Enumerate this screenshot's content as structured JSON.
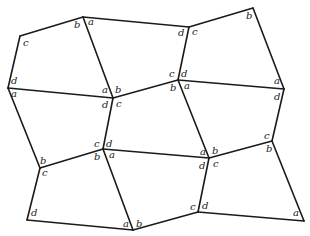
{
  "diagram": {
    "title": "",
    "stroke_color": "#1a1a1a",
    "background": "#ffffff",
    "vertices": {
      "P1": [
        20,
        36
      ],
      "P2": [
        83,
        17
      ],
      "P3": [
        189,
        27
      ],
      "P4": [
        253,
        8
      ],
      "P5": [
        8,
        88
      ],
      "P6": [
        113,
        98
      ],
      "P7": [
        178,
        80
      ],
      "P8": [
        284,
        89
      ],
      "P9": [
        40,
        168
      ],
      "P10": [
        103,
        149
      ],
      "P11": [
        209,
        158
      ],
      "P12": [
        272,
        141
      ],
      "P13": [
        27,
        220
      ],
      "P14": [
        133,
        230
      ],
      "P15": [
        198,
        212
      ],
      "P16": [
        304,
        221
      ]
    },
    "edges": [
      [
        "P1",
        "P2"
      ],
      [
        "P2",
        "P3"
      ],
      [
        "P3",
        "P4"
      ],
      [
        "P1",
        "P5"
      ],
      [
        "P2",
        "P6"
      ],
      [
        "P3",
        "P7"
      ],
      [
        "P4",
        "P8"
      ],
      [
        "P5",
        "P6"
      ],
      [
        "P6",
        "P7"
      ],
      [
        "P7",
        "P8"
      ],
      [
        "P5",
        "P9"
      ],
      [
        "P6",
        "P10"
      ],
      [
        "P7",
        "P11"
      ],
      [
        "P8",
        "P12"
      ],
      [
        "P9",
        "P10"
      ],
      [
        "P10",
        "P11"
      ],
      [
        "P11",
        "P12"
      ],
      [
        "P9",
        "P13"
      ],
      [
        "P10",
        "P14"
      ],
      [
        "P11",
        "P15"
      ],
      [
        "P12",
        "P16"
      ],
      [
        "P13",
        "P14"
      ],
      [
        "P14",
        "P15"
      ],
      [
        "P15",
        "P16"
      ]
    ],
    "labels": [
      {
        "text": "c",
        "x": 23,
        "y": 46
      },
      {
        "text": "b",
        "x": 74,
        "y": 28
      },
      {
        "text": "a",
        "x": 88,
        "y": 25
      },
      {
        "text": "d",
        "x": 178,
        "y": 36
      },
      {
        "text": "c",
        "x": 192,
        "y": 35
      },
      {
        "text": "b",
        "x": 246,
        "y": 19
      },
      {
        "text": "d",
        "x": 11,
        "y": 84
      },
      {
        "text": "a",
        "x": 11,
        "y": 97
      },
      {
        "text": "a",
        "x": 102,
        "y": 93
      },
      {
        "text": "b",
        "x": 115,
        "y": 93
      },
      {
        "text": "d",
        "x": 102,
        "y": 108
      },
      {
        "text": "c",
        "x": 116,
        "y": 107
      },
      {
        "text": "c",
        "x": 169,
        "y": 77
      },
      {
        "text": "d",
        "x": 181,
        "y": 77
      },
      {
        "text": "b",
        "x": 170,
        "y": 91
      },
      {
        "text": "a",
        "x": 184,
        "y": 89
      },
      {
        "text": "a",
        "x": 274,
        "y": 84
      },
      {
        "text": "d",
        "x": 274,
        "y": 100
      },
      {
        "text": "b",
        "x": 40,
        "y": 164
      },
      {
        "text": "c",
        "x": 42,
        "y": 176
      },
      {
        "text": "c",
        "x": 94,
        "y": 147
      },
      {
        "text": "d",
        "x": 106,
        "y": 147
      },
      {
        "text": "b",
        "x": 94,
        "y": 160
      },
      {
        "text": "a",
        "x": 109,
        "y": 158
      },
      {
        "text": "a",
        "x": 200,
        "y": 155
      },
      {
        "text": "b",
        "x": 212,
        "y": 154
      },
      {
        "text": "d",
        "x": 199,
        "y": 169
      },
      {
        "text": "c",
        "x": 213,
        "y": 167
      },
      {
        "text": "c",
        "x": 264,
        "y": 139
      },
      {
        "text": "b",
        "x": 266,
        "y": 152
      },
      {
        "text": "d",
        "x": 31,
        "y": 216
      },
      {
        "text": "a",
        "x": 123,
        "y": 227
      },
      {
        "text": "b",
        "x": 136,
        "y": 227
      },
      {
        "text": "c",
        "x": 190,
        "y": 210
      },
      {
        "text": "d",
        "x": 202,
        "y": 209
      },
      {
        "text": "a",
        "x": 293,
        "y": 216
      }
    ]
  }
}
